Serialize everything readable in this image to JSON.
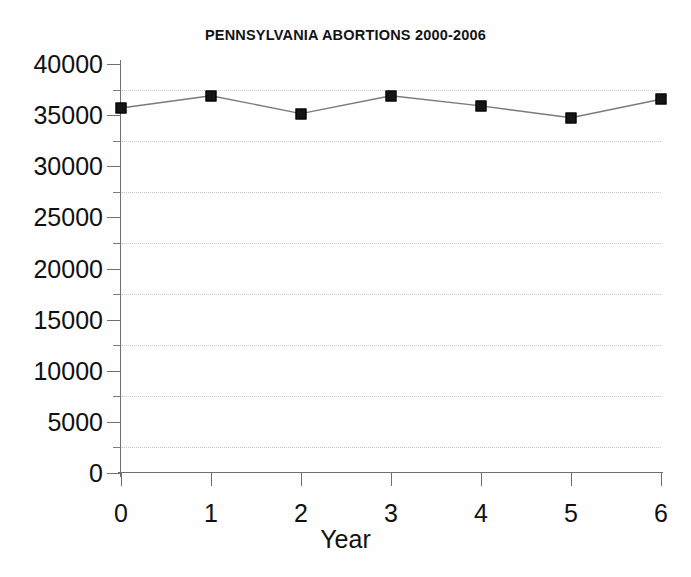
{
  "chart_data": {
    "type": "line",
    "title": "PENNSYLVANIA ABORTIONS 2000-2006",
    "xlabel": "Year",
    "ylabel": "",
    "x": [
      0,
      1,
      2,
      3,
      4,
      5,
      6
    ],
    "values": [
      35700,
      36900,
      35150,
      36900,
      35900,
      34750,
      36550
    ],
    "series": [
      {
        "name": "Abortions",
        "values": [
          35700,
          36900,
          35150,
          36900,
          35900,
          34750,
          36550
        ]
      }
    ],
    "xlim": [
      0,
      6
    ],
    "ylim": [
      0,
      40000
    ],
    "x_tick_labels": [
      "0",
      "1",
      "2",
      "3",
      "4",
      "5",
      "6"
    ],
    "y_tick_labels": [
      "40000",
      "35000",
      "30000",
      "25000",
      "20000",
      "15000",
      "10000",
      "5000",
      "0"
    ],
    "y_tick_values": [
      40000,
      35000,
      30000,
      25000,
      20000,
      15000,
      10000,
      5000,
      0
    ],
    "y_minor_tick_values": [
      37500,
      32500,
      27500,
      22500,
      17500,
      12500,
      7500,
      2500
    ],
    "gridlines": "horizontal-dotted-at-minor-ticks",
    "legend": "none",
    "marker": "filled-square",
    "line_color": "#7a7a7a",
    "marker_color": "#151515",
    "grid_color": "#c9c9c9",
    "axis_color": "#6f6f6f",
    "background_color": "#fefefe"
  }
}
